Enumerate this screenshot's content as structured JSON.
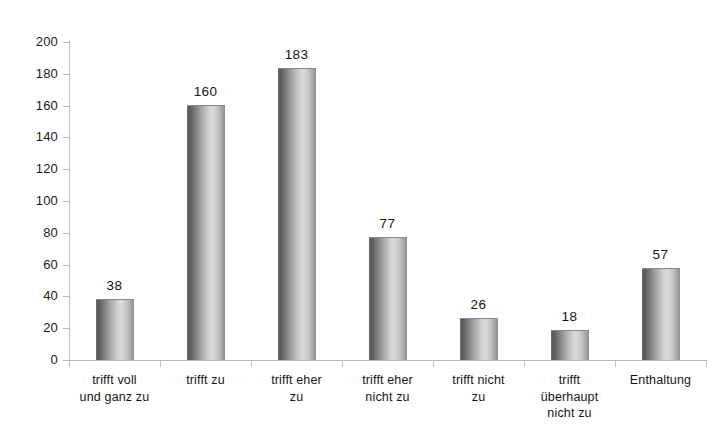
{
  "chart_data": {
    "type": "bar",
    "title": "",
    "subtitle": "",
    "xlabel": "",
    "ylabel": "",
    "categories": [
      "trifft voll und ganz zu",
      "trifft zu",
      "trifft eher zu",
      "trifft eher nicht zu",
      "trifft nicht zu",
      "trifft überhaupt nicht zu",
      "Enthaltung"
    ],
    "category_lines": [
      [
        "trifft voll",
        "und ganz  zu"
      ],
      [
        "trifft zu"
      ],
      [
        "trifft eher",
        "zu"
      ],
      [
        "trifft eher",
        "nicht zu"
      ],
      [
        "trifft nicht",
        "zu"
      ],
      [
        "trifft",
        "überhaupt",
        "nicht zu"
      ],
      [
        "Enthaltung"
      ]
    ],
    "values": [
      38,
      160,
      183,
      77,
      26,
      18,
      57
    ],
    "value_labels": [
      "38",
      "160",
      "183",
      "77",
      "26",
      "18",
      "57"
    ],
    "ylim": [
      0,
      200
    ],
    "ytick_step": 20,
    "yticks": [
      0,
      20,
      40,
      60,
      80,
      100,
      120,
      140,
      160,
      180,
      200
    ],
    "ytick_labels": [
      "0",
      "20",
      "40",
      "60",
      "80",
      "100",
      "120",
      "140",
      "160",
      "180",
      "200"
    ],
    "grid": false,
    "legend": false,
    "legend_position": "none",
    "bar_style": "cylinder-gradient-gray",
    "colors": {
      "background": "#ffffff",
      "bar_dark": "#575757",
      "bar_light": "#dadada",
      "bar_edge": "#8d8d8d",
      "axis": "#b9b9b9",
      "text": "#141414"
    }
  }
}
